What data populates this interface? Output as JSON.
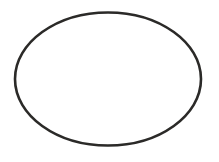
{
  "canvas": {
    "width": 219,
    "height": 162,
    "background_color": "#ffffff",
    "description": "Single hand-drawn ellipse outline on a blank white background"
  },
  "figure": {
    "shape_name": "ellipse",
    "label": "Ellipse outline",
    "stroke_color": "#2b2a28",
    "fill_color": "none",
    "stroke_width": 2.6,
    "geometry": {
      "center_x": 108,
      "center_y": 79,
      "radius_x": 93,
      "radius_y": 67,
      "left_extent_x": 15,
      "right_extent_x": 201,
      "top_extent_y": 12,
      "bottom_extent_y": 146
    },
    "path": "M 15 79 C 15 42.5 56.6 12.5 108 12.5 C 159.4 12.5 201 42.5 201 79 C 201 115.5 159.4 145.5 108 145.5 C 56.6 145.5 15 115.5 15 79 Z"
  }
}
